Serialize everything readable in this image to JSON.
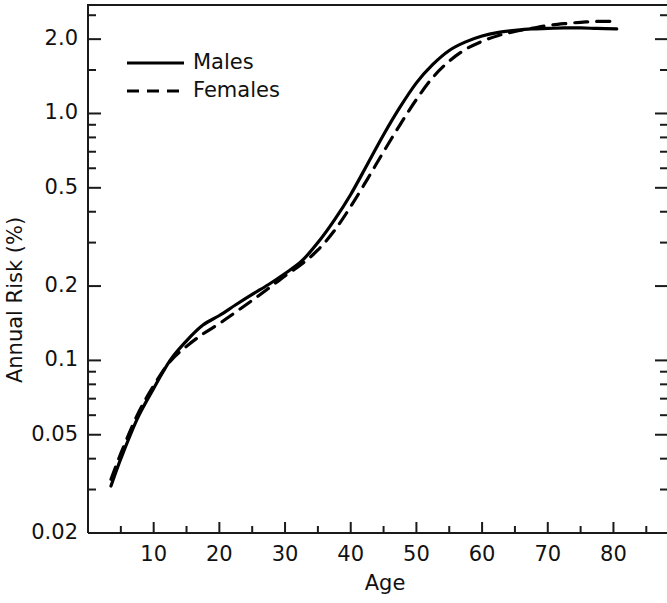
{
  "chart_data": {
    "type": "line",
    "title": "",
    "xlabel": "Age",
    "ylabel": "Annual Risk (%)",
    "xlim": [
      0,
      88
    ],
    "ylim": [
      0.02,
      2.75
    ],
    "yscale": "log",
    "grid": false,
    "legend_position": "top-left",
    "x_ticks": [
      10,
      20,
      30,
      40,
      50,
      60,
      70,
      80
    ],
    "x_tick_labels": [
      "10",
      "20",
      "30",
      "40",
      "50",
      "60",
      "70",
      "80"
    ],
    "x_minor_ticks": [
      5,
      15,
      25,
      35,
      45,
      55,
      65,
      75,
      85
    ],
    "y_ticks": [
      0.02,
      0.05,
      0.1,
      0.2,
      0.5,
      1.0,
      2.0
    ],
    "y_tick_labels": [
      "0.02",
      "0.05",
      "0.1",
      "0.2",
      "0.5",
      "1.0",
      "2.0"
    ],
    "y_minor_ticks": [
      0.03,
      0.04,
      0.06,
      0.07,
      0.08,
      0.09,
      0.3,
      0.4,
      0.6,
      0.7,
      0.8,
      0.9,
      1.5,
      2.5
    ],
    "x": [
      3.5,
      5,
      7.5,
      10,
      12.5,
      15,
      17.5,
      20,
      22.5,
      25,
      27.5,
      30,
      32.5,
      35,
      37.5,
      40,
      42.5,
      45,
      47.5,
      50,
      52.5,
      55,
      57.5,
      60,
      62.5,
      65,
      67.5,
      70,
      72.5,
      75,
      77.5,
      80.5
    ],
    "series": [
      {
        "name": "Males",
        "style": "solid",
        "values": [
          0.031,
          0.04,
          0.058,
          0.077,
          0.1,
          0.12,
          0.139,
          0.152,
          0.168,
          0.185,
          0.203,
          0.225,
          0.252,
          0.3,
          0.37,
          0.47,
          0.62,
          0.82,
          1.06,
          1.33,
          1.58,
          1.8,
          1.95,
          2.06,
          2.13,
          2.17,
          2.2,
          2.21,
          2.22,
          2.22,
          2.21,
          2.2
        ]
      },
      {
        "name": "Females",
        "style": "dashed",
        "values": [
          0.033,
          0.042,
          0.06,
          0.079,
          0.099,
          0.114,
          0.128,
          0.141,
          0.157,
          0.175,
          0.196,
          0.22,
          0.245,
          0.28,
          0.335,
          0.42,
          0.54,
          0.7,
          0.9,
          1.14,
          1.4,
          1.63,
          1.82,
          1.96,
          2.07,
          2.15,
          2.21,
          2.27,
          2.31,
          2.34,
          2.36,
          2.36
        ]
      }
    ]
  },
  "legend": {
    "entries": [
      {
        "label": "Males",
        "style": "solid"
      },
      {
        "label": "Females",
        "style": "dashed"
      }
    ]
  },
  "axes": {
    "y_title": "Annual Risk (%)",
    "x_title": "Age"
  }
}
